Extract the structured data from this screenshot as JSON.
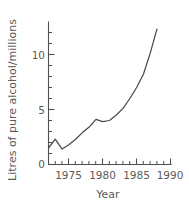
{
  "chart_data": {
    "type": "line",
    "title": "",
    "xlabel": "Year",
    "ylabel": "Litres of pure alcohol/millions",
    "xlim": [
      1972,
      1990
    ],
    "ylim": [
      0,
      12.7
    ],
    "grid": false,
    "legend": null,
    "x_ticks_major": [
      1975,
      1980,
      1985,
      1990
    ],
    "x_tick_labels": [
      "1975",
      "1980",
      "1985",
      "1990"
    ],
    "x_ticks_minor": [
      1972,
      1973,
      1974,
      1976,
      1977,
      1978,
      1979,
      1981,
      1982,
      1983,
      1984,
      1986,
      1987,
      1988,
      1989
    ],
    "y_ticks_major": [
      0,
      5,
      10
    ],
    "y_tick_labels": [
      "0",
      "5",
      "10"
    ],
    "y_ticks_minor": [
      1,
      2,
      3,
      4,
      6,
      7,
      8,
      9,
      11,
      12
    ],
    "x": [
      1972,
      1973,
      1974,
      1975,
      1976,
      1977,
      1978,
      1979,
      1980,
      1981,
      1982,
      1983,
      1984,
      1985,
      1986,
      1987,
      1988
    ],
    "values": [
      1.5,
      2.3,
      1.4,
      1.8,
      2.3,
      2.9,
      3.4,
      4.1,
      3.9,
      4.0,
      4.5,
      5.1,
      6.0,
      7.0,
      8.2,
      10.1,
      12.3
    ],
    "series": [
      {
        "name": "Litres of pure alcohol per millions",
        "values": [
          1.5,
          2.3,
          1.4,
          1.8,
          2.3,
          2.9,
          3.4,
          4.1,
          3.9,
          4.0,
          4.5,
          5.1,
          6.0,
          7.0,
          8.2,
          10.1,
          12.3
        ]
      }
    ],
    "line_color": "#4a4a4a",
    "background_color": "#ffffff"
  }
}
